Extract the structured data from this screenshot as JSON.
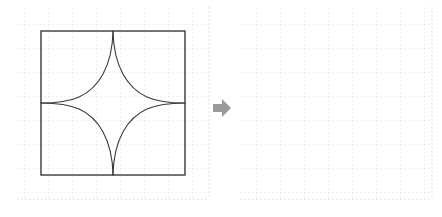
{
  "figure": {
    "type": "geometry-transformation-prompt",
    "background_color": "#ffffff",
    "grid_color": "#d9d9d9",
    "stroke_color": "#3a3a3a",
    "arrow_color": "#9a9a9a"
  },
  "left_panel": {
    "name": "source-figure",
    "grid": {
      "cols": 8,
      "rows": 8,
      "cell_size": 24,
      "origin_x": 17,
      "origin_y": 7,
      "width": 192,
      "height": 192,
      "style": "dotted",
      "color": "#d9d9d9"
    },
    "square": {
      "name": "bounding-square",
      "x": 41,
      "y": 31,
      "size": 144,
      "stroke": "#3a3a3a",
      "stroke_width": 1.4,
      "fill": "none"
    },
    "astroid": {
      "name": "astroid-curve",
      "center_x": 113,
      "center_y": 103,
      "radius": 72,
      "cusps": 4,
      "cusp_points": [
        {
          "label": "top",
          "x": 113,
          "y": 31
        },
        {
          "label": "right",
          "x": 185,
          "y": 103
        },
        {
          "label": "bottom",
          "x": 113,
          "y": 175
        },
        {
          "label": "left",
          "x": 41,
          "y": 103
        }
      ],
      "stroke": "#3a3a3a",
      "stroke_width": 1.1,
      "fill": "none"
    }
  },
  "arrow": {
    "name": "transformation-arrow",
    "direction": "right",
    "color": "#9a9a9a",
    "glyph": "right-arrow-icon"
  },
  "right_panel": {
    "name": "target-blank-grid",
    "grid": {
      "cols": 8,
      "rows": 8,
      "cell_size": 24,
      "origin_x": 8,
      "origin_y": 7,
      "width": 192,
      "height": 192,
      "style": "dotted",
      "color": "#d9d9d9"
    },
    "contents": ""
  }
}
